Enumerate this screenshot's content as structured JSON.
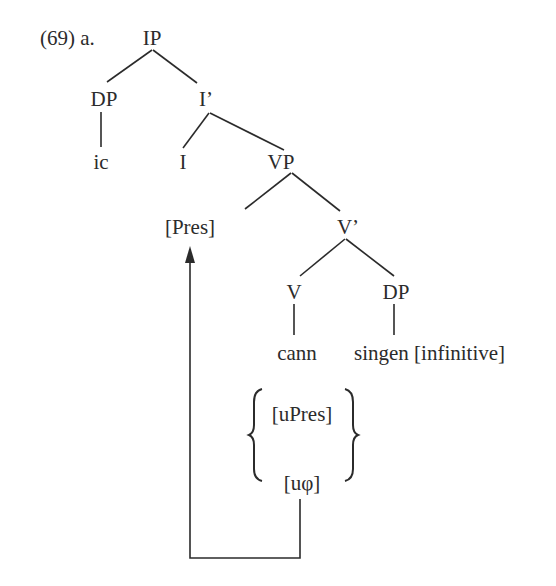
{
  "example": {
    "number": "(69) a."
  },
  "tree": {
    "nodes": {
      "ip": "IP",
      "dp_subject": "DP",
      "i_bar": "I’",
      "ic": "ic",
      "i_head": "I",
      "vp": "VP",
      "pres": "[Pres]",
      "v_bar": "V’",
      "v_head": "V",
      "dp_object": "DP",
      "cann": "cann",
      "singen": "singen [infinitive]"
    },
    "features": {
      "upres": "[uPres]",
      "uphi": "[uφ]"
    }
  },
  "colors": {
    "ink": "#2b2b2b",
    "background": "#ffffff"
  }
}
